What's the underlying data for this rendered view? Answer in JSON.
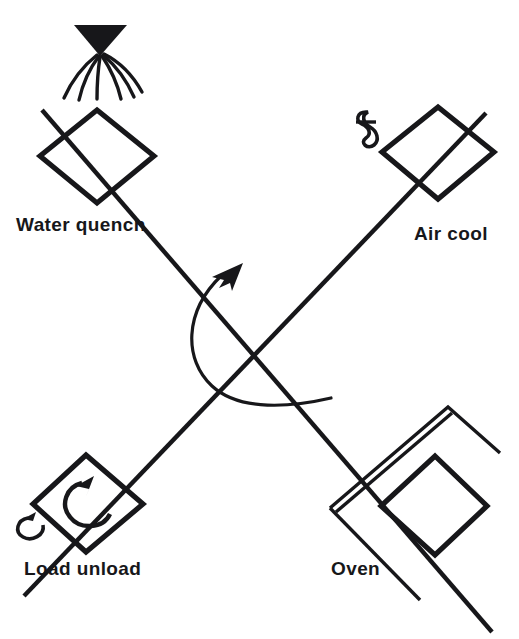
{
  "figure": {
    "background_color": "#ffffff",
    "ink_color": "#17171a",
    "width": 519,
    "height": 639
  },
  "stations": [
    {
      "id": "water-quench",
      "label": "Water quench",
      "position": "top-left",
      "label_x": 16,
      "label_y": 231,
      "icon": "spray-nozzle-icon",
      "center_x": 97,
      "center_y": 156
    },
    {
      "id": "air-cool",
      "label": "Air cool",
      "position": "top-right",
      "label_x": 414,
      "label_y": 240,
      "icon": "fan-icon",
      "center_x": 438,
      "center_y": 152
    },
    {
      "id": "oven",
      "label": "Oven",
      "position": "bottom-right",
      "label_x": 331,
      "label_y": 575,
      "icon": "oven-chamber-icon",
      "center_x": 428,
      "center_y": 505
    },
    {
      "id": "load-unload",
      "label": "Load unload",
      "position": "bottom-left",
      "label_x": 24,
      "label_y": 575,
      "icon": "rotation-arrow-icon",
      "center_x": 86,
      "center_y": 504
    }
  ],
  "annotations": {
    "rotation_arrow": "index-rotation-arc",
    "rotation_direction": "counter-clockwise",
    "spray_stream_count": 6,
    "arm_count": 2
  },
  "labels": {
    "water_quench": "Water quench",
    "air_cool": "Air cool",
    "oven": "Oven",
    "load_unload": "Load unload"
  }
}
